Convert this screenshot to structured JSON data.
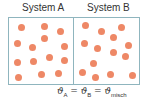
{
  "labels": {
    "system_a": "System A",
    "system_b": "System B"
  },
  "colors": {
    "particle": "#ee8866",
    "border": "#8fb5be",
    "text": "#333333"
  },
  "equation": {
    "symbol": "ϑ",
    "sub_a": "A",
    "sub_b": "B",
    "sub_mix": "misch",
    "eq": "="
  },
  "particles": {
    "system_a": [
      [
        21,
        27
      ],
      [
        44,
        26
      ],
      [
        60,
        31
      ],
      [
        17,
        43
      ],
      [
        44,
        38
      ],
      [
        32,
        47
      ],
      [
        64,
        46
      ],
      [
        17,
        62
      ],
      [
        33,
        61
      ],
      [
        49,
        57
      ],
      [
        64,
        60
      ],
      [
        18,
        77
      ],
      [
        41,
        74
      ],
      [
        58,
        73
      ]
    ],
    "system_b": [
      [
        85,
        25
      ],
      [
        101,
        31
      ],
      [
        121,
        27
      ],
      [
        84,
        43
      ],
      [
        97,
        48
      ],
      [
        113,
        37
      ],
      [
        128,
        45
      ],
      [
        113,
        52
      ],
      [
        125,
        56
      ],
      [
        93,
        63
      ],
      [
        82,
        72
      ],
      [
        95,
        77
      ],
      [
        110,
        74
      ],
      [
        132,
        75
      ]
    ]
  }
}
